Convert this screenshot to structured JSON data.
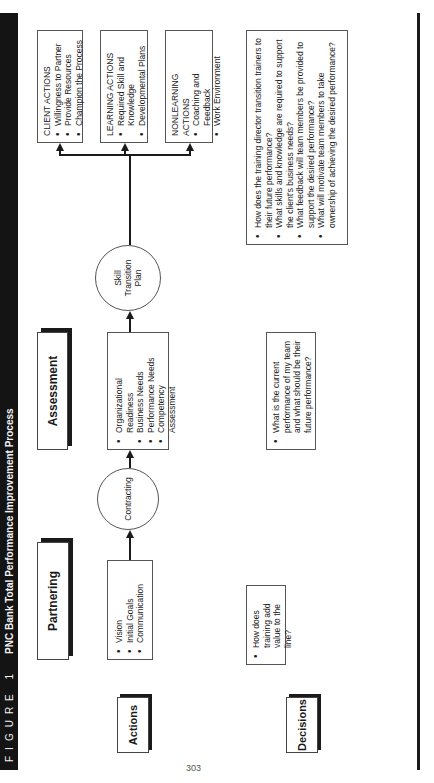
{
  "figure": {
    "label": "FIGURE 1",
    "title": "PNC Bank Total Performance Improvement Process"
  },
  "phases": {
    "partnering": "Partnering",
    "assessment": "Assessment"
  },
  "row_labels": {
    "actions": "Actions",
    "decisions": "Decisions"
  },
  "actions": {
    "partnering_items": [
      "Vision",
      "Initial Goals",
      "Communication"
    ],
    "contracting": "Contracting",
    "assessment_items": [
      "Organizational Readiness",
      "Business Needs",
      "Performance Needs",
      "Competency Assessment"
    ],
    "skill_transition_plan": "Skill Transition Plan",
    "outcomes": [
      {
        "header": "Client Actions",
        "items": [
          "Willingness to Partner",
          "Provide Resources",
          "Champion the Process"
        ]
      },
      {
        "header": "Learning Actions",
        "items": [
          "Required Skill and Knowledge",
          "Developmental Plans"
        ]
      },
      {
        "header": "Nonlearning Actions",
        "items": [
          "Coaching and Feedback",
          "Work Environment"
        ]
      }
    ]
  },
  "decisions": {
    "partnering": [
      "How does training add value to the line?"
    ],
    "assessment": [
      "What is the current performance of my team and what should be their future performance?"
    ],
    "transition": [
      "How does the training director transition trainers to their future performance?",
      "What skills and knowledge are required to support the client's business needs?",
      "What feedback will team members be provided to support the desired performance?",
      "What will motivate team members to take ownership of achieving the desired performance?"
    ]
  },
  "page_number": "303"
}
